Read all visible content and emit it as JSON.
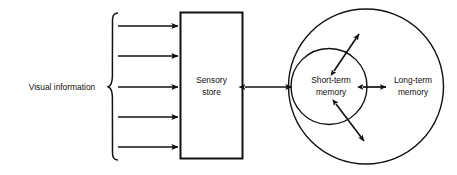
{
  "diagram": {
    "background_color": "#ffffff",
    "stroke_color": "#111111",
    "width": 457,
    "height": 175,
    "input_label": "Visual information",
    "brace": {
      "name": "left-curly-brace",
      "arrow_count": 5
    },
    "sensory_store": {
      "label_line1": "Sensory",
      "label_line2": "store",
      "shape": "rectangle"
    },
    "short_term_memory": {
      "label_line1": "Short-term",
      "label_line2": "memory",
      "shape": "circle"
    },
    "long_term_memory": {
      "label_line1": "Long-term",
      "label_line2": "memory",
      "shape": "circle"
    },
    "connectors": [
      {
        "name": "input-arrow-1",
        "direction": "right"
      },
      {
        "name": "input-arrow-2",
        "direction": "right"
      },
      {
        "name": "input-arrow-3",
        "direction": "right"
      },
      {
        "name": "input-arrow-4",
        "direction": "right"
      },
      {
        "name": "input-arrow-5",
        "direction": "right"
      },
      {
        "name": "sensory-to-stm-arrow",
        "direction": "bidirectional"
      },
      {
        "name": "stm-to-ltm-arrow",
        "direction": "right"
      },
      {
        "name": "stm-upper-diagonal-arrow",
        "direction": "bidirectional"
      },
      {
        "name": "stm-lower-diagonal-arrow",
        "direction": "bidirectional"
      }
    ]
  }
}
